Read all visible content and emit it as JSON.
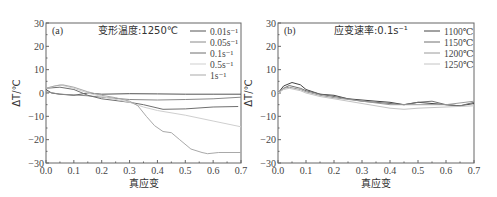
{
  "chart_data": [
    {
      "type": "line",
      "panel_label": "(a)",
      "condition": "变形温度:1250℃",
      "xlabel": "真应变",
      "ylabel": "ΔT/℃",
      "xlim": [
        0.0,
        0.7
      ],
      "ylim": [
        -30,
        30
      ],
      "xticks": [
        "0.0",
        "0.1",
        "0.2",
        "0.3",
        "0.4",
        "0.5",
        "0.6",
        "0.7"
      ],
      "yticks": [
        "30",
        "20",
        "10",
        "0",
        "-10",
        "-20",
        "-30"
      ],
      "grid": false,
      "legend_position": "upper right",
      "series": [
        {
          "name": "0.01s⁻¹",
          "color": "#555555",
          "x": [
            0.0,
            0.02,
            0.05,
            0.1,
            0.15,
            0.2,
            0.3,
            0.4,
            0.5,
            0.6,
            0.7
          ],
          "y": [
            1.5,
            0,
            -0.5,
            -1,
            0,
            -0.5,
            -0.3,
            -0.4,
            -0.5,
            -0.5,
            -0.5
          ]
        },
        {
          "name": "0.05s⁻¹",
          "color": "#8a8a8a",
          "x": [
            0.0,
            0.05,
            0.1,
            0.15,
            0.2,
            0.3,
            0.4,
            0.5,
            0.6,
            0.7
          ],
          "y": [
            0.5,
            -0.5,
            -0.8,
            -1.2,
            -1.8,
            -2.8,
            -3.0,
            -2.8,
            -2.5,
            -1.8
          ]
        },
        {
          "name": "0.1s⁻¹",
          "color": "#6f6f6f",
          "x": [
            0.0,
            0.05,
            0.1,
            0.15,
            0.2,
            0.3,
            0.35,
            0.42,
            0.5,
            0.6,
            0.69
          ],
          "y": [
            2,
            2.5,
            1.5,
            -1,
            -2.5,
            -4,
            -5,
            -7,
            -6.8,
            -6,
            -5.8
          ]
        },
        {
          "name": "0.5s⁻¹",
          "color": "#cfcfcf",
          "x": [
            0.0,
            0.05,
            0.1,
            0.15,
            0.2,
            0.3,
            0.35,
            0.4,
            0.5,
            0.6,
            0.7
          ],
          "y": [
            2,
            3.5,
            2,
            0,
            -1.5,
            -4,
            -6,
            -7.5,
            -9.5,
            -12,
            -14.5
          ]
        },
        {
          "name": "1s⁻¹",
          "color": "#a9a9a9",
          "x": [
            0.0,
            0.03,
            0.06,
            0.1,
            0.15,
            0.2,
            0.25,
            0.3,
            0.33,
            0.36,
            0.39,
            0.42,
            0.45,
            0.48,
            0.52,
            0.56,
            0.58,
            0.62,
            0.7
          ],
          "y": [
            2,
            3,
            3.5,
            2.5,
            0.5,
            -1,
            -2,
            -3.5,
            -5.5,
            -10,
            -14,
            -16.5,
            -17,
            -20,
            -24,
            -25.5,
            -26,
            -25.5,
            -25.5
          ]
        }
      ]
    },
    {
      "type": "line",
      "panel_label": "(b)",
      "condition": "应变速率:0.1s⁻¹",
      "xlabel": "真应变",
      "ylabel": "ΔT/℃",
      "xlim": [
        0.0,
        0.7
      ],
      "ylim": [
        -30,
        30
      ],
      "xticks": [
        "0.0",
        "0.1",
        "0.2",
        "0.3",
        "0.4",
        "0.5",
        "0.6",
        "0.7"
      ],
      "yticks": [
        "30",
        "20",
        "10",
        "0",
        "-10",
        "-20",
        "-30"
      ],
      "grid": false,
      "legend_position": "upper right",
      "series": [
        {
          "name": "1100℃",
          "color": "#444444",
          "x": [
            0.0,
            0.02,
            0.05,
            0.08,
            0.1,
            0.15,
            0.2,
            0.25,
            0.3,
            0.35,
            0.4,
            0.45,
            0.5,
            0.55,
            0.6,
            0.65,
            0.7
          ],
          "y": [
            0,
            3,
            4.5,
            3.5,
            1.5,
            -0.5,
            -1,
            -2.5,
            -3,
            -3.5,
            -4,
            -5,
            -4,
            -4.5,
            -5,
            -5.5,
            -4.5
          ]
        },
        {
          "name": "1150℃",
          "color": "#707070",
          "x": [
            0.0,
            0.02,
            0.04,
            0.08,
            0.1,
            0.15,
            0.2,
            0.3,
            0.4,
            0.45,
            0.5,
            0.55,
            0.6,
            0.65,
            0.7
          ],
          "y": [
            0,
            2,
            3.2,
            2,
            1,
            -0.5,
            -1.5,
            -3.5,
            -4.5,
            -5,
            -4,
            -3.5,
            -5,
            -5.5,
            -4
          ]
        },
        {
          "name": "1200℃",
          "color": "#9a9a9a",
          "x": [
            0.0,
            0.02,
            0.04,
            0.08,
            0.1,
            0.15,
            0.2,
            0.3,
            0.4,
            0.5,
            0.6,
            0.7
          ],
          "y": [
            0,
            2,
            2.5,
            1.5,
            0.5,
            -1,
            -2,
            -3.5,
            -5,
            -5,
            -5,
            -3.5
          ]
        },
        {
          "name": "1250℃",
          "color": "#c4c4c4",
          "x": [
            0.0,
            0.02,
            0.04,
            0.08,
            0.1,
            0.15,
            0.2,
            0.3,
            0.4,
            0.45,
            0.5,
            0.6,
            0.7
          ],
          "y": [
            0,
            1.5,
            2,
            1,
            0,
            -1.5,
            -2.5,
            -4.5,
            -6.5,
            -7,
            -6.5,
            -6,
            -5.5
          ]
        }
      ]
    }
  ]
}
